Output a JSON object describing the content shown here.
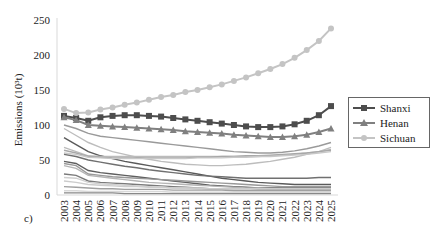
{
  "chart_data": {
    "type": "line",
    "title": "",
    "panel_label": "c)",
    "xlabel": "",
    "ylabel": "Emissions (10³t)",
    "ylim": [
      0,
      250
    ],
    "yticks": [
      0,
      50,
      100,
      150,
      200,
      250
    ],
    "grid": false,
    "legend_position": "right",
    "x": [
      "2003",
      "2004",
      "2005",
      "2006",
      "2007",
      "2008",
      "2009",
      "2010",
      "2011",
      "2012",
      "2013",
      "2014",
      "2015",
      "2016",
      "2017",
      "2018",
      "2019",
      "2020",
      "2021",
      "2022",
      "2023",
      "2024",
      "2025"
    ],
    "series": [
      {
        "name": "Shanxi",
        "color": "#4d4d4d",
        "marker": "square",
        "values": [
          113,
          110,
          106,
          111,
          113,
          114,
          114,
          113,
          112,
          110,
          108,
          106,
          104,
          102,
          100,
          98,
          97,
          97,
          98,
          101,
          106,
          114,
          127
        ]
      },
      {
        "name": "Henan",
        "color": "#808080",
        "marker": "triangle",
        "values": [
          111,
          107,
          100,
          99,
          98,
          97,
          96,
          95,
          94,
          93,
          91,
          90,
          89,
          88,
          86,
          85,
          84,
          83,
          83,
          84,
          86,
          90,
          95
        ]
      },
      {
        "name": "Sichuan",
        "color": "#c4c4c4",
        "marker": "circle",
        "values": [
          123,
          117,
          118,
          122,
          125,
          129,
          132,
          136,
          140,
          143,
          147,
          150,
          154,
          158,
          163,
          168,
          174,
          180,
          187,
          196,
          207,
          220,
          238
        ]
      }
    ],
    "unlabeled_series_note": "Many additional unlabeled grey lines for other provinces",
    "background_series": [
      {
        "color": "#9a9a9a",
        "values": [
          100,
          95,
          88,
          84,
          82,
          80,
          78,
          76,
          74,
          72,
          70,
          68,
          66,
          64,
          62,
          61,
          60,
          60,
          61,
          63,
          66,
          70,
          75
        ]
      },
      {
        "color": "#bdbdbd",
        "values": [
          95,
          85,
          75,
          68,
          62,
          58,
          54,
          51,
          48,
          46,
          44,
          43,
          42,
          42,
          43,
          44,
          46,
          48,
          51,
          54,
          58,
          62,
          68
        ]
      },
      {
        "color": "#5a5a5a",
        "values": [
          82,
          72,
          62,
          56,
          52,
          48,
          45,
          42,
          39,
          36,
          33,
          30,
          27,
          24,
          22,
          20,
          18,
          17,
          16,
          15,
          15,
          15,
          15
        ]
      },
      {
        "color": "#bbbbbb",
        "values": [
          68,
          62,
          56,
          55,
          55,
          55,
          55,
          55,
          55,
          55,
          55,
          55,
          55,
          55,
          55,
          55,
          55,
          56,
          57,
          58,
          60,
          62,
          65
        ]
      },
      {
        "color": "#a8a8a8",
        "values": [
          64,
          60,
          55,
          54,
          53,
          53,
          53,
          53,
          53,
          53,
          53,
          54,
          54,
          55,
          55,
          56,
          56,
          57,
          58,
          59,
          60,
          62,
          64
        ]
      },
      {
        "color": "#c8c8c8",
        "values": [
          60,
          58,
          54,
          53,
          52,
          52,
          52,
          52,
          52,
          52,
          52,
          53,
          53,
          53,
          54,
          54,
          55,
          55,
          56,
          57,
          58,
          60,
          62
        ]
      },
      {
        "color": "#707070",
        "values": [
          58,
          55,
          50,
          47,
          44,
          41,
          39,
          36,
          34,
          32,
          30,
          28,
          27,
          26,
          25,
          24,
          24,
          24,
          24,
          24,
          24,
          25,
          25
        ]
      },
      {
        "color": "#5f5f5f",
        "values": [
          48,
          45,
          35,
          32,
          30,
          28,
          26,
          24,
          22,
          20,
          18,
          16,
          14,
          13,
          12,
          11,
          10,
          10,
          10,
          10,
          10,
          10,
          10
        ]
      },
      {
        "color": "#999999",
        "values": [
          45,
          42,
          30,
          28,
          26,
          25,
          24,
          23,
          22,
          21,
          20,
          19,
          18,
          17,
          16,
          15,
          14,
          13,
          12,
          12,
          12,
          12,
          12
        ]
      },
      {
        "color": "#b5b5b5",
        "values": [
          42,
          38,
          28,
          26,
          24,
          22,
          20,
          18,
          17,
          16,
          15,
          14,
          13,
          12,
          11,
          10,
          10,
          9,
          9,
          9,
          9,
          9,
          9
        ]
      },
      {
        "color": "#7a7a7a",
        "values": [
          30,
          28,
          20,
          18,
          17,
          16,
          15,
          14,
          13,
          12,
          11,
          10,
          9,
          9,
          8,
          8,
          8,
          8,
          8,
          8,
          8,
          8,
          8
        ]
      },
      {
        "color": "#d0d0d0",
        "values": [
          25,
          24,
          18,
          16,
          15,
          14,
          13,
          12,
          11,
          10,
          10,
          9,
          9,
          8,
          8,
          8,
          7,
          7,
          7,
          7,
          7,
          7,
          7
        ]
      },
      {
        "color": "#cccccc",
        "values": [
          20,
          18,
          15,
          14,
          13,
          12,
          12,
          11,
          11,
          10,
          10,
          10,
          9,
          9,
          9,
          9,
          9,
          9,
          9,
          9,
          9,
          9,
          9
        ]
      },
      {
        "color": "#a0a0a0",
        "values": [
          12,
          11,
          10,
          9,
          9,
          8,
          8,
          8,
          8,
          7,
          7,
          7,
          7,
          7,
          6,
          6,
          6,
          6,
          6,
          6,
          6,
          6,
          6
        ]
      },
      {
        "color": "#d8d8d8",
        "values": [
          6,
          6,
          5,
          5,
          5,
          5,
          5,
          5,
          5,
          4,
          4,
          4,
          4,
          4,
          4,
          4,
          4,
          4,
          4,
          4,
          4,
          4,
          4
        ]
      },
      {
        "color": "#888888",
        "values": [
          3,
          3,
          3,
          3,
          3,
          2,
          2,
          2,
          2,
          2,
          2,
          2,
          2,
          2,
          2,
          2,
          2,
          2,
          2,
          2,
          2,
          2,
          2
        ]
      }
    ]
  },
  "legend": {
    "items": [
      {
        "label": "Shanxi",
        "color": "#4d4d4d"
      },
      {
        "label": "Henan",
        "color": "#808080"
      },
      {
        "label": "Sichuan",
        "color": "#c4c4c4"
      }
    ]
  }
}
